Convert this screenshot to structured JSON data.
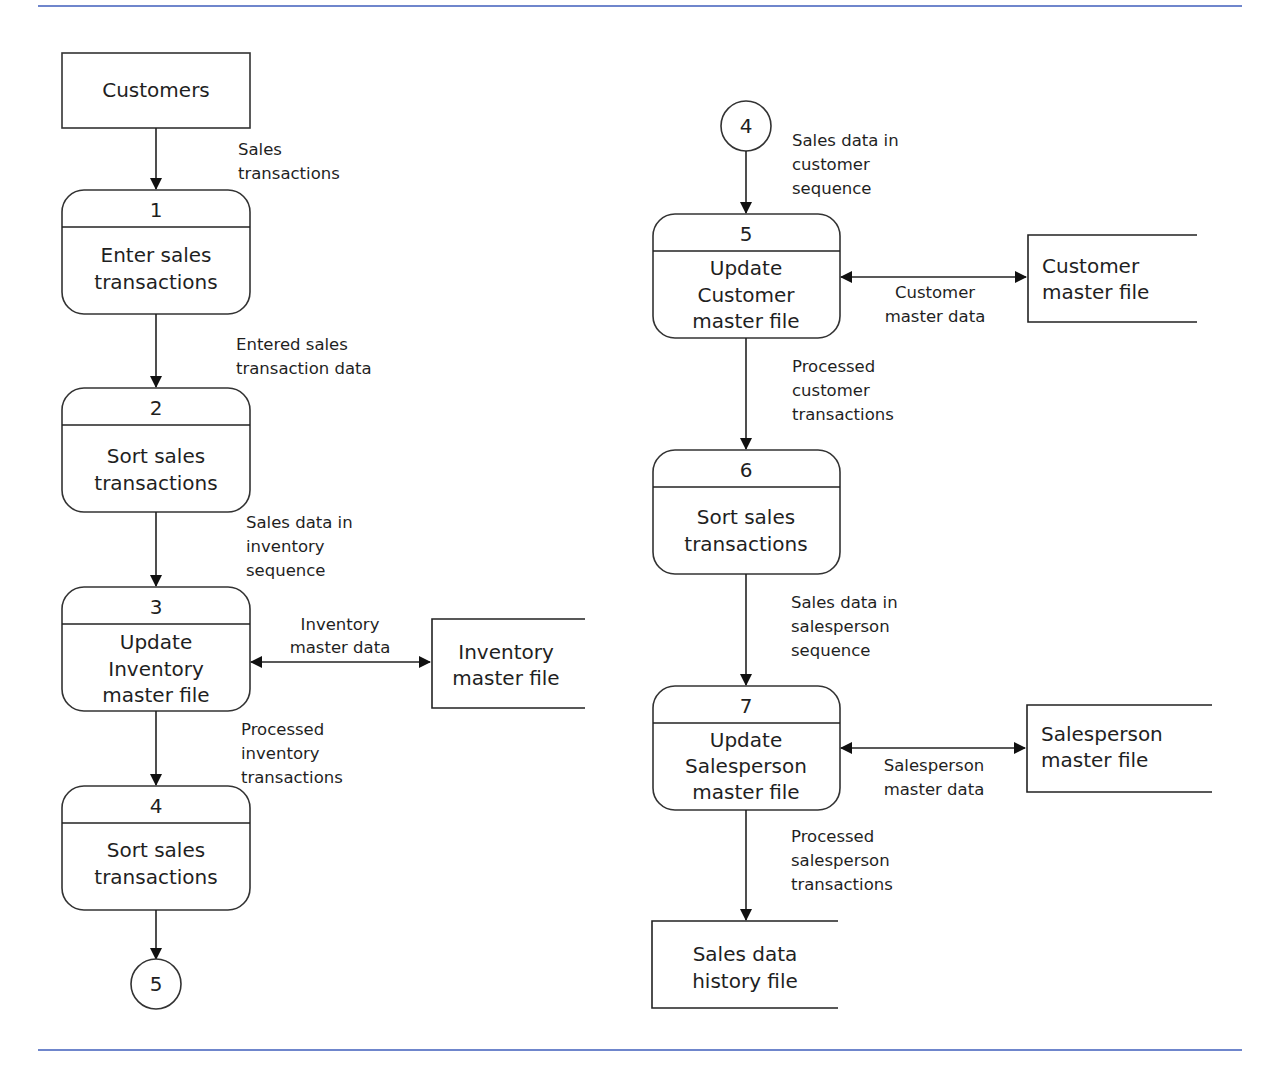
{
  "diagram": {
    "type": "data-flow-diagram",
    "external_entity": {
      "label": "Customers"
    },
    "left_column": {
      "flows": [
        {
          "lines": [
            "Sales",
            "transactions"
          ]
        },
        {
          "lines": [
            "Entered sales",
            "transaction data"
          ]
        },
        {
          "lines": [
            "Sales data in",
            "inventory",
            "sequence"
          ]
        },
        {
          "lines": [
            "Processed",
            "inventory",
            "transactions"
          ]
        }
      ],
      "processes": [
        {
          "number": "1",
          "lines": [
            "Enter sales",
            "transactions"
          ]
        },
        {
          "number": "2",
          "lines": [
            "Sort sales",
            "transactions"
          ]
        },
        {
          "number": "3",
          "lines": [
            "Update",
            "Inventory",
            "master file"
          ]
        },
        {
          "number": "4",
          "lines": [
            "Sort sales",
            "transactions"
          ]
        }
      ],
      "data_store": {
        "lines": [
          "Inventory",
          "master file"
        ]
      },
      "data_store_flow": {
        "lines": [
          "Inventory",
          "master data"
        ]
      },
      "connector_out": {
        "label": "5"
      }
    },
    "right_column": {
      "connector_in": {
        "label": "4"
      },
      "flows": [
        {
          "lines": [
            "Sales data in",
            "customer",
            "sequence"
          ]
        },
        {
          "lines": [
            "Processed",
            "customer",
            "transactions"
          ]
        },
        {
          "lines": [
            "Sales data in",
            "salesperson",
            "sequence"
          ]
        },
        {
          "lines": [
            "Processed",
            "salesperson",
            "transactions"
          ]
        }
      ],
      "processes": [
        {
          "number": "5",
          "lines": [
            "Update",
            "Customer",
            "master file"
          ]
        },
        {
          "number": "6",
          "lines": [
            "Sort sales",
            "transactions"
          ]
        },
        {
          "number": "7",
          "lines": [
            "Update",
            "Salesperson",
            "master file"
          ]
        }
      ],
      "data_stores": [
        {
          "lines": [
            "Customer",
            "master file"
          ]
        },
        {
          "lines": [
            "Salesperson",
            "master file"
          ]
        },
        {
          "lines": [
            "Sales data",
            "history file"
          ]
        }
      ],
      "data_store_flows": [
        {
          "lines": [
            "Customer",
            "master data"
          ]
        },
        {
          "lines": [
            "Salesperson",
            "master data"
          ]
        }
      ]
    },
    "colors": {
      "rule": "#6f86cc",
      "stroke": "#333333",
      "text": "#1f1f1f"
    }
  }
}
